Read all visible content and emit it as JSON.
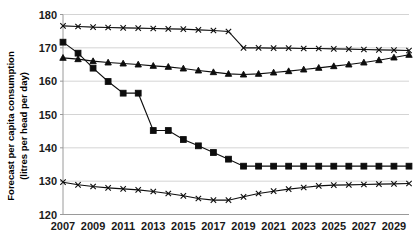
{
  "chart_data": {
    "type": "line",
    "title": "",
    "xlabel": "",
    "ylabel": "Forecast per capita consumption (litres per head per day)",
    "ylabel_line1": "Forecast per capita consumption",
    "ylabel_line2": "(litres per head per day)",
    "ylim": [
      120,
      180
    ],
    "y_ticks": [
      120,
      130,
      140,
      150,
      160,
      170,
      180
    ],
    "xlim": [
      2007,
      2030
    ],
    "x_ticks": [
      2007,
      2009,
      2011,
      2013,
      2015,
      2017,
      2019,
      2021,
      2023,
      2025,
      2027,
      2029
    ],
    "x": [
      2007,
      2008,
      2009,
      2010,
      2011,
      2012,
      2013,
      2014,
      2015,
      2016,
      2017,
      2018,
      2019,
      2020,
      2021,
      2022,
      2023,
      2024,
      2025,
      2026,
      2027,
      2028,
      2029,
      2030
    ],
    "grid": true,
    "legend": "none",
    "series": [
      {
        "name": "series-top-cross",
        "marker": "x",
        "values": [
          176.6,
          176.4,
          176.2,
          176.1,
          176.0,
          175.9,
          175.8,
          175.7,
          175.6,
          175.4,
          175.2,
          174.9,
          170.0,
          170.0,
          169.9,
          169.9,
          169.8,
          169.8,
          169.7,
          169.6,
          169.5,
          169.4,
          169.3,
          169.2
        ]
      },
      {
        "name": "series-middle-triangle",
        "marker": "triangle",
        "values": [
          167.0,
          166.6,
          166.0,
          165.6,
          165.3,
          165.0,
          164.6,
          164.3,
          163.8,
          163.2,
          162.7,
          162.2,
          162.0,
          162.2,
          162.6,
          163.0,
          163.5,
          164.0,
          164.5,
          165.0,
          165.6,
          166.3,
          167.1,
          167.9
        ]
      },
      {
        "name": "series-lower-square",
        "marker": "square",
        "values": [
          171.7,
          168.4,
          163.9,
          159.9,
          156.4,
          156.4,
          145.2,
          145.2,
          142.5,
          140.6,
          138.6,
          136.6,
          134.5,
          134.5,
          134.5,
          134.5,
          134.5,
          134.5,
          134.5,
          134.5,
          134.5,
          134.5,
          134.5,
          134.5
        ]
      },
      {
        "name": "series-bottom-cross",
        "marker": "x",
        "values": [
          129.7,
          128.9,
          128.4,
          128.0,
          127.7,
          127.4,
          126.9,
          126.3,
          125.6,
          124.8,
          124.3,
          124.3,
          125.3,
          126.3,
          127.0,
          127.6,
          128.1,
          128.6,
          128.8,
          128.9,
          129.0,
          129.1,
          129.2,
          129.3
        ]
      }
    ]
  }
}
